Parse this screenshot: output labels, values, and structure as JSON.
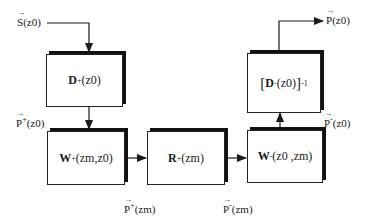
{
  "diagram": {
    "title": "",
    "colors": {
      "line": "#1a1a1a",
      "box_shadow": "#111111",
      "background": "#ffffff"
    },
    "inputs": {
      "source": {
        "symbol": "S",
        "arg": "(z0)"
      }
    },
    "outputs": {
      "result": {
        "symbol": "P",
        "arg": "(z0)"
      }
    },
    "boxes": [
      {
        "id": "D_plus",
        "op": "D",
        "sup": "+",
        "arg": "(z0)"
      },
      {
        "id": "W_plus",
        "op": "W",
        "sup": "+",
        "arg": "(zm,z0)"
      },
      {
        "id": "R_plus",
        "op": "R",
        "sup": "+",
        "arg": "(zm)"
      },
      {
        "id": "W_minus",
        "op": "W",
        "sup": "-",
        "arg": "(z0 ,zm)"
      },
      {
        "id": "D_minus_inv",
        "open": "[",
        "op": "D",
        "sup": "-",
        "arg": "(z0)",
        "close": "]",
        "power": "-1"
      }
    ],
    "signals": [
      {
        "id": "P_plus_z0",
        "symbol": "P",
        "sup": "+",
        "arg": "(z0)"
      },
      {
        "id": "P_plus_zm",
        "symbol": "P",
        "sup": "+",
        "arg": "(zm)"
      },
      {
        "id": "P_minus_zm",
        "symbol": "P",
        "sup": "-",
        "arg": "(zm)"
      },
      {
        "id": "P_minus_z0",
        "symbol": "P",
        "sup": "-",
        "arg": "(z0)"
      }
    ],
    "edges": [
      {
        "from": "S(z0)",
        "to": "D_plus"
      },
      {
        "from": "D_plus",
        "to": "W_plus",
        "label": "P+(z0)"
      },
      {
        "from": "W_plus",
        "to": "R_plus",
        "label": "P+(zm)"
      },
      {
        "from": "R_plus",
        "to": "W_minus",
        "label": "P-(zm)"
      },
      {
        "from": "W_minus",
        "to": "D_minus_inv",
        "label": "P-(z0)"
      },
      {
        "from": "D_minus_inv",
        "to": "P(z0)"
      }
    ]
  }
}
